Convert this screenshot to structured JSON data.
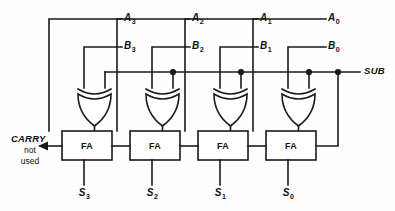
{
  "diagram": {
    "colors": {
      "line": "#1a1a1a",
      "background": "#fefefe",
      "text": "#111111"
    },
    "control": {
      "sub_label": "SUB",
      "sub_line_y": 72
    },
    "carry_out": {
      "label": "CARRY",
      "note_line1": "not",
      "note_line2": "used"
    },
    "fa_label": "FA",
    "stages": [
      {
        "index": 3,
        "a_label": "A",
        "a_sub": "3",
        "b_label": "B",
        "b_sub": "3",
        "s_label": "S",
        "s_sub": "3",
        "fa_label": "FA",
        "gate": "xor"
      },
      {
        "index": 2,
        "a_label": "A",
        "a_sub": "2",
        "b_label": "B",
        "b_sub": "2",
        "s_label": "S",
        "s_sub": "2",
        "fa_label": "FA",
        "gate": "xor"
      },
      {
        "index": 1,
        "a_label": "A",
        "a_sub": "1",
        "b_label": "B",
        "b_sub": "1",
        "s_label": "S",
        "s_sub": "1",
        "fa_label": "FA",
        "gate": "xor"
      },
      {
        "index": 0,
        "a_label": "A",
        "a_sub": "0",
        "b_label": "B",
        "b_sub": "0",
        "s_label": "S",
        "s_sub": "0",
        "fa_label": "FA",
        "gate": "xor"
      }
    ]
  }
}
